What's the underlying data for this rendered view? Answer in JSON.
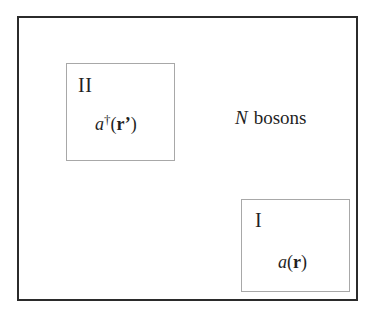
{
  "figure": {
    "background_color": "#ffffff",
    "boundary_color": "#2b2b2b",
    "region_border_color": "#a8a8a8",
    "text_color": "#1f1f1f"
  },
  "system": {
    "name": "boson-system-boundary",
    "annotation": {
      "count_symbol": "N",
      "noun": "bosons",
      "full_text": "N bosons"
    }
  },
  "regions": [
    {
      "id": "region-two",
      "label": "II",
      "operator": {
        "symbol": "a",
        "dagger": "†",
        "open_paren": "(",
        "argument": "r",
        "prime": "’",
        "close_paren": ")",
        "full_text": "a†(r’)"
      }
    },
    {
      "id": "region-one",
      "label": "I",
      "operator": {
        "symbol": "a",
        "dagger": "",
        "open_paren": "(",
        "argument": "r",
        "prime": "",
        "close_paren": ")",
        "full_text": "a(r)"
      }
    }
  ]
}
